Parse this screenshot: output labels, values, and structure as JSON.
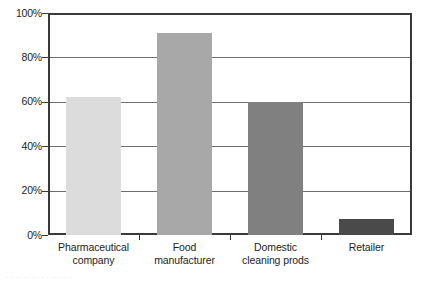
{
  "chart_data": {
    "type": "bar",
    "title": "",
    "subtitle": "",
    "xlabel": "",
    "ylabel": "",
    "categories": [
      "Pharmaceutical company",
      "Food manufacturer",
      "Domestic cleaning prods",
      "Retailer"
    ],
    "category_lines": [
      [
        "Pharmaceutical",
        "company"
      ],
      [
        "Food",
        "manufacturer"
      ],
      [
        "Domestic",
        "cleaning prods"
      ],
      [
        "Retailer"
      ]
    ],
    "values": [
      62,
      91,
      60,
      7
    ],
    "value_labels": [
      "62%",
      "91%",
      "60%",
      "7%"
    ],
    "bar_colors": [
      "#dcdcdc",
      "#a8a8a8",
      "#808080",
      "#4a4a4a"
    ],
    "ylim": [
      0,
      100
    ],
    "yticks": [
      0,
      20,
      40,
      60,
      80,
      100
    ],
    "ytick_labels": [
      "0%",
      "20%",
      "40%",
      "60%",
      "80%",
      "100%"
    ],
    "grid": true,
    "grid_axis": "y",
    "legend": false,
    "legend_position": "none",
    "frame_color": "#3a3a3a",
    "grid_color": "#6e6e6e",
    "background": "#ffffff"
  },
  "caption": {
    "remnant_text": "· ·  ·· ··  ···   · ·     ···        ··         ·"
  }
}
